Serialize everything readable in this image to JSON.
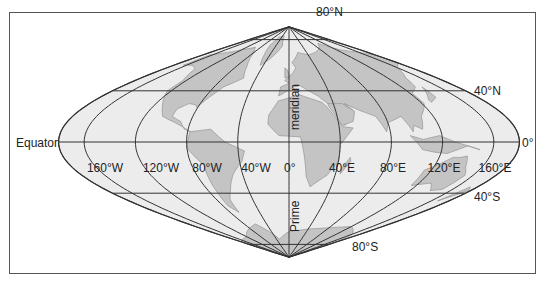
{
  "figure": {
    "projection": "sinusoidal",
    "colors": {
      "frame": "#555555",
      "grid": "#333333",
      "ocean": "#ececec",
      "land": "#c4c4c4",
      "land_stroke": "#8a8a8a",
      "background": "#ffffff"
    }
  },
  "geometry": {
    "center_x": 289,
    "center_y": 142,
    "scale": 1.28
  },
  "meridians": [
    -180,
    -160,
    -120,
    -80,
    -40,
    0,
    40,
    80,
    120,
    160,
    180
  ],
  "parallels": [
    80,
    40,
    0,
    -40,
    -80
  ],
  "labels": {
    "equator": "Equator",
    "equator_right": "0°",
    "lat_80n": "80°N",
    "lat_40n": "40°N",
    "lat_40s": "40°S",
    "lat_80s": "80°S",
    "prime_meridian_upper": "meridian",
    "prime_meridian_lower": "Prime",
    "lon_0": "0°",
    "lon_labels": [
      {
        "text": "160°W",
        "x": 105
      },
      {
        "text": "120°W",
        "x": 161
      },
      {
        "text": "80°W",
        "x": 207
      },
      {
        "text": "40°W",
        "x": 256
      },
      {
        "text": "40°E",
        "x": 342
      },
      {
        "text": "80°E",
        "x": 393
      },
      {
        "text": "120°E",
        "x": 444
      },
      {
        "text": "160°E",
        "x": 495
      }
    ]
  }
}
